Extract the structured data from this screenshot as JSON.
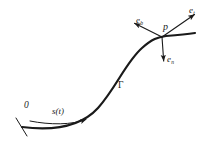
{
  "figure": {
    "type": "frenet-frame-curve-diagram",
    "background_color": "#ffffff",
    "stroke_color": "#1a1a1a",
    "width": 216,
    "height": 142,
    "curve": {
      "name": "curve-gamma",
      "label": "Γ",
      "label_position": {
        "x": 118,
        "y": 81
      },
      "stroke_width": 2.2,
      "description": "S-shaped space curve rising from lower-left to upper-right",
      "path": "M 22 127 C 46 130, 78 130, 98 108 C 116 88, 126 62, 142 48 C 152 39, 158 37, 166 36 C 178 35, 188 34, 195 33"
    },
    "origin_marker": {
      "name": "origin-tick",
      "label": "0",
      "label_position": {
        "x": 24,
        "y": 101
      },
      "tick_from": {
        "x": 16,
        "y": 118
      },
      "tick_to": {
        "x": 26,
        "y": 135
      },
      "stroke_width": 1.0
    },
    "arc_length_arrow": {
      "name": "arc-length-arrow",
      "label": "s(t)",
      "label_position": {
        "x": 52,
        "y": 107
      },
      "path": "M 30 121 C 50 125, 72 125, 88 119",
      "stroke_width": 1.0,
      "arrow_head": "filled-triangle"
    },
    "point": {
      "name": "point-p",
      "label": "p",
      "label_position": {
        "x": 163,
        "y": 22
      },
      "x": 162,
      "y": 37,
      "dot_radius": 0.0
    },
    "vectors": [
      {
        "name": "tangent-vector",
        "label": "e",
        "subscript": "t",
        "label_position": {
          "x": 189,
          "y": 6
        },
        "from": {
          "x": 162,
          "y": 37
        },
        "to": {
          "x": 197,
          "y": 13
        },
        "stroke_width": 1.1,
        "direction": "up-right"
      },
      {
        "name": "binormal-vector",
        "label": "e",
        "subscript": "b",
        "label_position": {
          "x": 136,
          "y": 16
        },
        "from": {
          "x": 162,
          "y": 37
        },
        "to": {
          "x": 132,
          "y": 22
        },
        "stroke_width": 1.1,
        "direction": "up-left"
      },
      {
        "name": "normal-vector",
        "label": "e",
        "subscript": "n",
        "label_position": {
          "x": 167,
          "y": 55
        },
        "from": {
          "x": 162,
          "y": 37
        },
        "to": {
          "x": 164,
          "y": 64
        },
        "stroke_width": 1.1,
        "direction": "down"
      }
    ]
  }
}
